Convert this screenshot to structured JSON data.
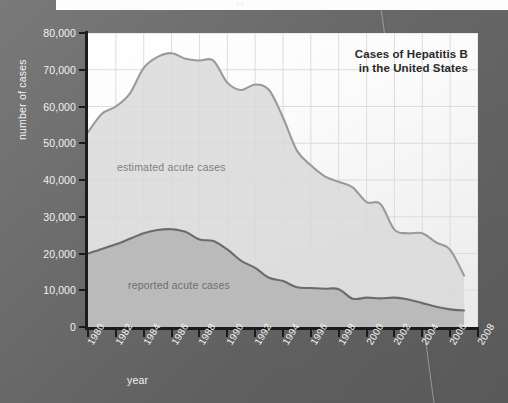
{
  "banner": {
    "ghost_text": "· ·"
  },
  "chart_data": {
    "type": "area",
    "title_line1": "Cases of Hepatitis B",
    "title_line2": "in the United States",
    "xlabel": "year",
    "ylabel": "number of cases",
    "xlim": [
      1980,
      2008
    ],
    "ylim": [
      0,
      80000
    ],
    "grid": true,
    "legend_position": "inline-annotation",
    "x_ticks": [
      1980,
      1982,
      1984,
      1986,
      1988,
      1990,
      1992,
      1994,
      1996,
      1998,
      2000,
      2002,
      2004,
      2006,
      2008
    ],
    "y_ticks": [
      0,
      10000,
      20000,
      30000,
      40000,
      50000,
      60000,
      70000,
      80000
    ],
    "y_tick_labels": [
      "0",
      "10,000",
      "20,000",
      "30,000",
      "40,000",
      "50,000",
      "60,000",
      "70,000",
      "80,000"
    ],
    "x": [
      1980,
      1981,
      1982,
      1983,
      1984,
      1985,
      1986,
      1987,
      1988,
      1989,
      1990,
      1991,
      1992,
      1993,
      1994,
      1995,
      1996,
      1997,
      1998,
      1999,
      2000,
      2001,
      2002,
      2003,
      2004,
      2005,
      2006,
      2007
    ],
    "series": [
      {
        "name": "estimated acute cases",
        "color": "#9a9a9a",
        "fill": "#d9d9d9",
        "values": [
          53000,
          58000,
          60000,
          63500,
          70500,
          73500,
          74500,
          73000,
          72500,
          72500,
          66500,
          64500,
          66000,
          64500,
          57000,
          48000,
          44000,
          41000,
          39500,
          38000,
          34000,
          33500,
          26500,
          25500,
          25500,
          23000,
          21000,
          14000
        ]
      },
      {
        "name": "reported acute cases",
        "color": "#6b6b6b",
        "fill": "#b4b4b4",
        "values": [
          20000,
          21200,
          22500,
          24000,
          25500,
          26400,
          26600,
          25900,
          23800,
          23400,
          21100,
          18000,
          16100,
          13400,
          12500,
          10800,
          10600,
          10400,
          10300,
          7700,
          8000,
          7800,
          8000,
          7500,
          6500,
          5500,
          4800,
          4500
        ]
      }
    ]
  }
}
